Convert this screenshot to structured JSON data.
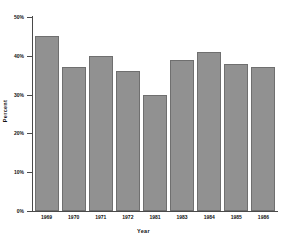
{
  "chart_data": {
    "type": "bar",
    "title": "",
    "xlabel": "Year",
    "ylabel": "Percent",
    "categories": [
      "1969",
      "1970",
      "1971",
      "1972",
      "1981",
      "1983",
      "1984",
      "1985",
      "1986"
    ],
    "values": [
      45,
      37,
      40,
      36,
      30,
      39,
      41,
      38,
      37
    ],
    "ylim": [
      0,
      50
    ],
    "ytick_values": [
      0,
      10,
      20,
      30,
      40,
      50
    ],
    "ytick_labels": [
      "0%",
      "10%",
      "20%",
      "30%",
      "40%",
      "50%"
    ],
    "grid": false,
    "legend": null,
    "series": [
      {
        "name": "Percent",
        "values": [
          45,
          37,
          40,
          36,
          30,
          39,
          41,
          38,
          37
        ]
      }
    ],
    "colors": {
      "bar_fill": "#919191",
      "bar_border": "#6f6f6f",
      "background": "#ffffff",
      "axis": "#4a4a4a",
      "text": "#111111"
    }
  }
}
